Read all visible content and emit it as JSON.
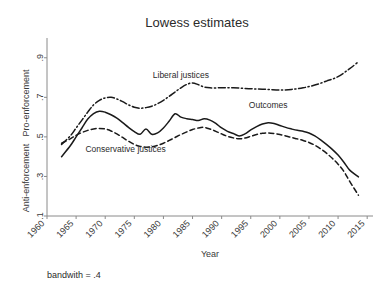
{
  "chart_data": {
    "type": "line",
    "title": "Lowess estimates",
    "xlabel": "Year",
    "ylabel_top": "Pro-enforcement",
    "ylabel_bottom": "Anti-enforcement",
    "note": "bandwith = .4",
    "grid": false,
    "legend_position": "inline-annotations",
    "xlim": [
      1960,
      2016
    ],
    "ylim": [
      0.1,
      1.0
    ],
    "xticks": [
      "1960",
      "1965",
      "1970",
      "1975",
      "1980",
      "1985",
      "1990",
      "1995",
      "2000",
      "2005",
      "2010",
      "2015"
    ],
    "xtick_values": [
      1960,
      1965,
      1970,
      1975,
      1980,
      1985,
      1990,
      1995,
      2000,
      2005,
      2010,
      2015
    ],
    "yticks": [
      ".1",
      ".3",
      ".5",
      ".7",
      ".9"
    ],
    "ytick_values": [
      0.1,
      0.3,
      0.5,
      0.7,
      0.9
    ],
    "series": [
      {
        "name": "Liberal justices",
        "style": "dash-dot",
        "color": "#1a1a1a",
        "label_x": 1983,
        "label_y": 0.8,
        "x": [
          1962.5,
          1964,
          1965,
          1966,
          1967,
          1968,
          1969,
          1970,
          1971,
          1972,
          1973,
          1974,
          1975,
          1976,
          1977,
          1978,
          1979,
          1980,
          1981,
          1982,
          1983,
          1984,
          1985,
          1986,
          1987,
          1988,
          1990,
          1992,
          1994,
          1996,
          1998,
          2000,
          2002,
          2004,
          2006,
          2008,
          2010,
          2012,
          2013.5
        ],
        "y": [
          0.462,
          0.505,
          0.545,
          0.585,
          0.625,
          0.662,
          0.685,
          0.697,
          0.7,
          0.692,
          0.678,
          0.662,
          0.65,
          0.645,
          0.648,
          0.655,
          0.668,
          0.685,
          0.705,
          0.727,
          0.748,
          0.765,
          0.773,
          0.764,
          0.752,
          0.748,
          0.748,
          0.748,
          0.745,
          0.742,
          0.74,
          0.737,
          0.74,
          0.748,
          0.762,
          0.782,
          0.805,
          0.845,
          0.88
        ]
      },
      {
        "name": "Outcomes",
        "style": "solid",
        "color": "#1a1a1a",
        "label_x": 1998,
        "label_y": 0.645,
        "x": [
          1962.5,
          1964,
          1965,
          1966,
          1967,
          1968,
          1969,
          1970,
          1971,
          1972,
          1973,
          1974,
          1975,
          1976,
          1977,
          1978,
          1979,
          1980,
          1981,
          1982,
          1983,
          1984,
          1985,
          1986,
          1987,
          1988,
          1989,
          1990,
          1991,
          1992,
          1993,
          1994,
          1995,
          1996,
          1997,
          1998,
          1999,
          2000,
          2001,
          2002,
          2003,
          2004,
          2005,
          2006,
          2007,
          2008,
          2009,
          2010,
          2011,
          2012,
          2013.5
        ],
        "y": [
          0.4,
          0.455,
          0.5,
          0.545,
          0.59,
          0.618,
          0.63,
          0.625,
          0.612,
          0.595,
          0.572,
          0.548,
          0.527,
          0.513,
          0.54,
          0.513,
          0.52,
          0.545,
          0.58,
          0.617,
          0.6,
          0.592,
          0.588,
          0.583,
          0.592,
          0.585,
          0.568,
          0.545,
          0.528,
          0.517,
          0.505,
          0.515,
          0.535,
          0.552,
          0.565,
          0.572,
          0.568,
          0.558,
          0.548,
          0.54,
          0.533,
          0.528,
          0.52,
          0.505,
          0.485,
          0.462,
          0.437,
          0.408,
          0.372,
          0.332,
          0.298
        ]
      },
      {
        "name": "Conservative justices",
        "style": "dashed",
        "color": "#1a1a1a",
        "label_x": 1973.5,
        "label_y": 0.425,
        "x": [
          1962.5,
          1964,
          1965,
          1966,
          1967,
          1968,
          1969,
          1970,
          1971,
          1972,
          1973,
          1974,
          1975,
          1976,
          1977,
          1978,
          1979,
          1980,
          1981,
          1982,
          1983,
          1984,
          1985,
          1986,
          1987,
          1988,
          1989,
          1990,
          1991,
          1992,
          1993,
          1994,
          1995,
          1996,
          1997,
          1998,
          1999,
          2000,
          2001,
          2002,
          2003,
          2004,
          2005,
          2006,
          2007,
          2008,
          2009,
          2010,
          2011,
          2012,
          2013.5
        ],
        "y": [
          0.468,
          0.49,
          0.508,
          0.522,
          0.533,
          0.54,
          0.543,
          0.54,
          0.53,
          0.515,
          0.497,
          0.478,
          0.462,
          0.452,
          0.448,
          0.45,
          0.457,
          0.468,
          0.482,
          0.497,
          0.512,
          0.525,
          0.537,
          0.545,
          0.548,
          0.54,
          0.528,
          0.515,
          0.503,
          0.495,
          0.49,
          0.494,
          0.503,
          0.512,
          0.518,
          0.52,
          0.517,
          0.512,
          0.505,
          0.497,
          0.49,
          0.482,
          0.472,
          0.458,
          0.44,
          0.418,
          0.392,
          0.362,
          0.325,
          0.275,
          0.205
        ]
      }
    ]
  }
}
